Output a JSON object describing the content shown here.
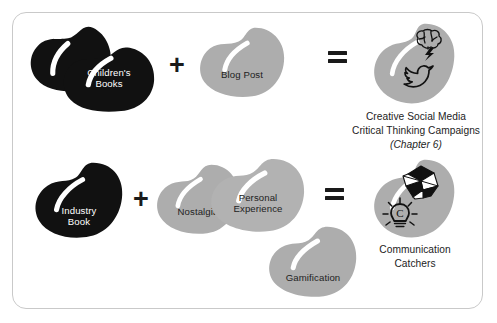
{
  "diagram": {
    "title_visible": false,
    "colors": {
      "bean_dark": "#111111",
      "bean_gray": "#adadad",
      "bean_gray_light": "#b6b6b6",
      "frame_border": "#c9c9c9",
      "text_dark": "#232323",
      "text_light": "#ffffff",
      "background": "#ffffff"
    },
    "rows": [
      {
        "id": "row-1",
        "inputs": [
          {
            "id": "childrens-books",
            "label": "Children's\nBooks",
            "tone": "dark"
          },
          {
            "id": "blog-post",
            "label": "Blog Post",
            "tone": "gray"
          }
        ],
        "operators": {
          "plus": "+",
          "equals": "="
        },
        "result": {
          "id": "creative-social-media",
          "caption_line1": "Creative Social Media",
          "caption_line2": "Critical Thinking Campaigns",
          "caption_line3": "(Chapter 6)",
          "icons": [
            "brain-icon",
            "lightning-bolt-icon",
            "twitter-bird-icon"
          ]
        }
      },
      {
        "id": "row-2",
        "inputs": [
          {
            "id": "industry-book",
            "label": "Industry\nBook",
            "tone": "dark"
          },
          {
            "id": "nostalgia",
            "label": "Nostalgia",
            "tone": "gray"
          },
          {
            "id": "personal-experience",
            "label": "Personal\nExperience",
            "tone": "gray"
          },
          {
            "id": "gamification",
            "label": "Gamification",
            "tone": "gray"
          }
        ],
        "operators": {
          "plus": "+",
          "equals": "="
        },
        "result": {
          "id": "communication-catchers",
          "caption_line1": "Communication",
          "caption_line2": "Catchers",
          "icons": [
            "cootie-catcher-icon",
            "lightbulb-idea-icon"
          ]
        }
      }
    ]
  }
}
